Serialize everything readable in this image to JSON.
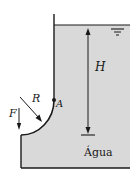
{
  "diagram": {
    "labels": {
      "height": "H",
      "radius": "R",
      "hinge": "A",
      "force": "F",
      "fluid": "Água"
    },
    "colors": {
      "water_fill": "#d9d9d9",
      "line": "#1a1a1a",
      "background": "#ffffff"
    }
  }
}
